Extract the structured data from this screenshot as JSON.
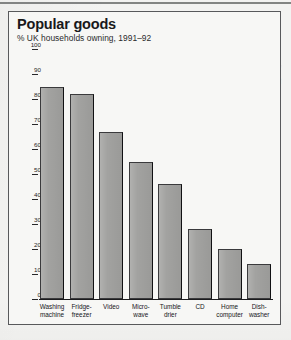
{
  "page": {
    "bleed_through_text": "Who hates those\nthe"
  },
  "chart": {
    "title": "Popular goods",
    "subtitle": "% UK households owning, 1991–92"
  },
  "chart_data": {
    "type": "bar",
    "title": "Popular goods",
    "subtitle": "% UK households owning, 1991–92",
    "xlabel": "",
    "ylabel": "",
    "ylim": [
      0,
      100
    ],
    "ytick_labels": [
      "100",
      "90",
      "80",
      "70",
      "60",
      "50",
      "40",
      "30",
      "20",
      "10",
      "0"
    ],
    "yticks": [
      100,
      90,
      80,
      70,
      60,
      50,
      40,
      30,
      20,
      10,
      0
    ],
    "grid": false,
    "legend": "none",
    "bar_color": "#a2a2a0",
    "categories": [
      "Washing\nmachine",
      "Fridge-\nfreezer",
      "Video",
      "Micro-\nwave",
      "Tumble\ndrier",
      "CD",
      "Home\ncomputer",
      "Dish-\nwasher"
    ],
    "values": [
      85,
      82,
      67,
      55,
      46,
      28,
      20,
      14
    ]
  }
}
